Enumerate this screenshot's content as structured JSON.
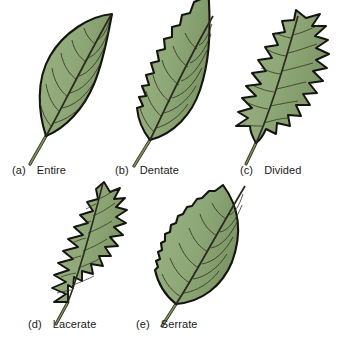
{
  "figure": {
    "background_color": "#ffffff",
    "label_color": "#1a1a1a"
  },
  "palette": {
    "leaf_fill": "#8fa878",
    "leaf_fill_light": "#a8bd8d",
    "leaf_fill_dark": "#79935f",
    "outline": "#141410",
    "vein": "#2b2b20",
    "stem": "#6f7f52",
    "stem_outline": "#2d2d1f"
  },
  "leaves": [
    {
      "tag": "(a)",
      "name": "Entire",
      "margin_type": "entire",
      "description": "Smooth, unbroken leaf margin with no teeth or lobes"
    },
    {
      "tag": "(b)",
      "name": "Dentate",
      "margin_type": "dentate",
      "description": "Margin with coarse, rounded outward-pointing teeth"
    },
    {
      "tag": "(c)",
      "name": "Divided",
      "margin_type": "divided",
      "description": "Deeply lobed margin with sinuses cut nearly to the midrib"
    },
    {
      "tag": "(d)",
      "name": "Lacerate",
      "margin_type": "lacerate",
      "description": "Narrow blade with sharp, irregular backward-pointing teeth"
    },
    {
      "tag": "(e)",
      "name": "Serrate",
      "margin_type": "serrate",
      "description": "Margin with fine, forward-pointing saw-like teeth"
    }
  ]
}
